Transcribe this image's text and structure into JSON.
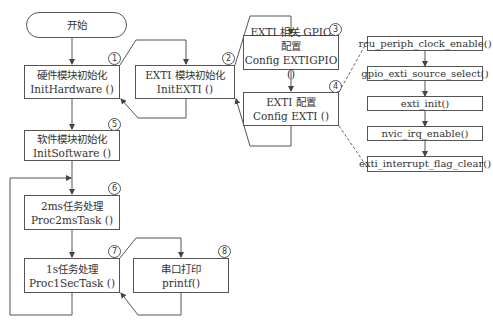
{
  "nodes": {
    "start": {
      "label": "开始"
    },
    "init_hardware": {
      "cn": "硬件模块初始化",
      "fn": "InitHardware ()",
      "num": "1"
    },
    "init_exti": {
      "cn": "EXTI 模块初始化",
      "fn": "InitEXTI ()",
      "num": "2"
    },
    "config_exti_gpio": {
      "cn": "EXTI 相关 GPIO 配置",
      "fn": "Config EXTIGPIO ()",
      "num": "3"
    },
    "config_exti": {
      "cn": "EXTI 配置",
      "fn": "Config EXTI ()",
      "num": "4"
    },
    "init_software": {
      "cn": "软件模块初始化",
      "fn": "InitSoftware ()",
      "num": "5"
    },
    "proc_2ms": {
      "cn": "2ms任务处理",
      "fn": "Proc2msTask ()",
      "num": "6"
    },
    "proc_1s": {
      "cn": "1s任务处理",
      "fn": "Proc1SecTask ()",
      "num": "7"
    },
    "printf": {
      "cn": "串口打印",
      "fn": "printf()",
      "num": "8"
    }
  },
  "exti_config_steps": [
    "rcu_periph_clock_enable()",
    "gpio_exti_source_select()",
    "exti_init()",
    "nvic_irq_enable()",
    "exti_interrupt_flag_clear()"
  ],
  "colors": {
    "line": "#555555",
    "text": "#333333",
    "background": "#ffffff"
  }
}
